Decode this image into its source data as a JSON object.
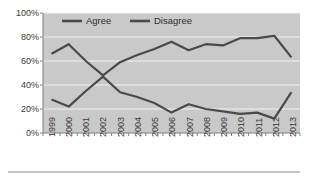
{
  "chart_data": {
    "type": "line",
    "title": "",
    "subtitle": "",
    "xlabel": "",
    "ylabel": "",
    "categories": [
      "1999",
      "2000",
      "2001",
      "2002",
      "2003",
      "2004",
      "2005",
      "2006",
      "2007",
      "2008",
      "2009",
      "2010",
      "2011",
      "2012",
      "2013"
    ],
    "series": [
      {
        "name": "Agree",
        "color": "#4a4a4a",
        "values": [
          28,
          22,
          35,
          47,
          34,
          30,
          25,
          17,
          24,
          20,
          18,
          16,
          17,
          12,
          34
        ]
      },
      {
        "name": "Disagree",
        "color": "#4a4a4a",
        "values": [
          66,
          74,
          60,
          48,
          59,
          65,
          70,
          76,
          69,
          74,
          73,
          79,
          79,
          81,
          63
        ]
      }
    ],
    "ylim": [
      0,
      100
    ],
    "ytick_values": [
      0,
      20,
      40,
      60,
      80,
      100
    ],
    "ytick_labels": [
      "0%",
      "20%",
      "40%",
      "60%",
      "80%",
      "100%"
    ],
    "grid": true,
    "grid_orientation": "horizontal",
    "legend_position": "top-inside",
    "legend_entries": [
      "Agree",
      "Disagree"
    ],
    "plot_background": "#c9c9c9",
    "gridline_color": "#f2f2f2",
    "axis_color": "#808080",
    "xtick_rotation": "vertical",
    "annotations": []
  },
  "legend": {
    "agree_label": "Agree",
    "disagree_label": "Disagree"
  },
  "yaxis": {
    "t0": "0%",
    "t1": "20%",
    "t2": "40%",
    "t3": "60%",
    "t4": "80%",
    "t5": "100%"
  },
  "xaxis": {
    "t0": "1999",
    "t1": "2000",
    "t2": "2001",
    "t3": "2002",
    "t4": "2003",
    "t5": "2004",
    "t6": "2005",
    "t7": "2006",
    "t8": "2007",
    "t9": "2008",
    "t10": "2009",
    "t11": "2010",
    "t12": "2011",
    "t13": "2012",
    "t14": "2013"
  }
}
